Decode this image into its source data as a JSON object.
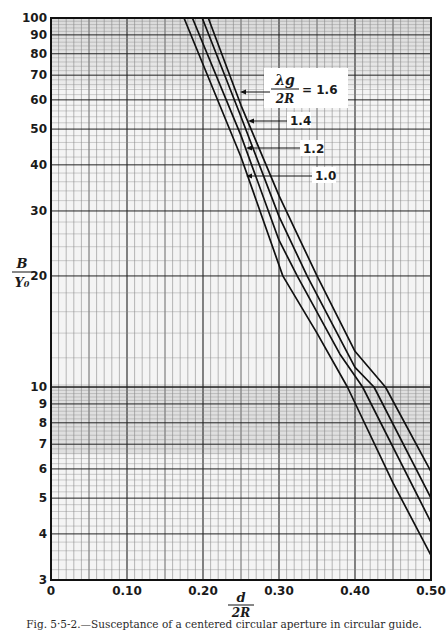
{
  "figure": {
    "caption": "Fig. 5·5-2.—Susceptance of a centered circular aperture in circular guide."
  },
  "axes": {
    "x_label_num": "d",
    "x_label_den": "2R",
    "y_label_num": "B",
    "y_label_den": "Y₀",
    "x_ticks": [
      "0",
      "0.10",
      "0.20",
      "0.30",
      "0.40",
      "0.50"
    ],
    "y_ticks": [
      "3",
      "4",
      "5",
      "6",
      "7",
      "8",
      "9",
      "10",
      "20",
      "30",
      "40",
      "50",
      "60",
      "70",
      "80",
      "90",
      "100"
    ]
  },
  "legend": {
    "param_num": "λg",
    "param_den": "2R",
    "equals": "= 1.6",
    "labels": [
      "1.4",
      "1.2",
      "1.0"
    ]
  },
  "chart_data": {
    "type": "line",
    "title": "Susceptance of a centered circular aperture in circular guide",
    "xlabel": "d/2R",
    "ylabel": "B/Y0",
    "xlim": [
      0,
      0.5
    ],
    "ylim": [
      3,
      100
    ],
    "yscale": "log",
    "grid": true,
    "legend_position": "inline annotations, upper right",
    "series": [
      {
        "name": "λg/2R = 1.6",
        "x": [
          0.207,
          0.25,
          0.3,
          0.35,
          0.4,
          0.44,
          0.5
        ],
        "y": [
          100,
          58,
          33,
          20,
          12.5,
          10,
          5.9
        ]
      },
      {
        "name": "λg/2R = 1.4",
        "x": [
          0.199,
          0.25,
          0.3,
          0.337,
          0.4,
          0.425,
          0.5
        ],
        "y": [
          100,
          54,
          29,
          20,
          11.3,
          10,
          5.0
        ]
      },
      {
        "name": "λg/2R = 1.2",
        "x": [
          0.186,
          0.25,
          0.3,
          0.324,
          0.38,
          0.41,
          0.5
        ],
        "y": [
          100,
          48,
          25,
          20,
          12.3,
          10,
          4.3
        ]
      },
      {
        "name": "λg/2R = 1.0",
        "x": [
          0.175,
          0.25,
          0.305,
          0.35,
          0.39,
          0.45,
          0.5
        ],
        "y": [
          100,
          42,
          20,
          14,
          10,
          5.5,
          3.5
        ]
      }
    ]
  }
}
